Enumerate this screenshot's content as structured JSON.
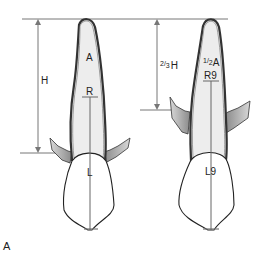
{
  "figure": {
    "panel_label": "A",
    "colors": {
      "root_fill": "#ececec",
      "root_outline": "#555555",
      "bone_fill": "#9a9a9a",
      "outline": "#222222",
      "measure_line": "#777777"
    },
    "teeth": [
      {
        "id": "original",
        "height_label": "H",
        "apex_label": "A",
        "root_label": "R",
        "crown_label": "L"
      },
      {
        "id": "resorbed",
        "height_label_fraction_num": "2",
        "height_label_fraction_den": "3",
        "height_label_suffix": "H",
        "apex_label_fraction_num": "1",
        "apex_label_fraction_den": "2",
        "apex_label_suffix": "A",
        "root_label": "R9",
        "crown_label": "L9"
      }
    ]
  }
}
